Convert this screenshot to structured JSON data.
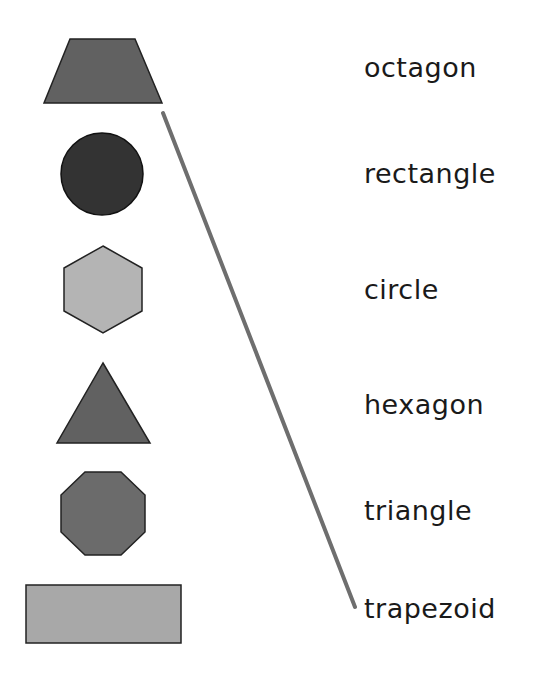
{
  "worksheet": {
    "shapes": [
      {
        "name": "trapezoid",
        "fill": "#616161"
      },
      {
        "name": "circle",
        "fill": "#333333"
      },
      {
        "name": "hexagon",
        "fill": "#b4b4b4"
      },
      {
        "name": "triangle",
        "fill": "#616161"
      },
      {
        "name": "octagon",
        "fill": "#6b6b6b"
      },
      {
        "name": "rectangle",
        "fill": "#a8a8a8"
      }
    ],
    "words": [
      "octagon",
      "rectangle",
      "circle",
      "hexagon",
      "triangle",
      "trapezoid"
    ],
    "matches": [
      {
        "shape": "trapezoid",
        "word": "trapezoid",
        "line_color": "#6e6e6e"
      }
    ]
  }
}
